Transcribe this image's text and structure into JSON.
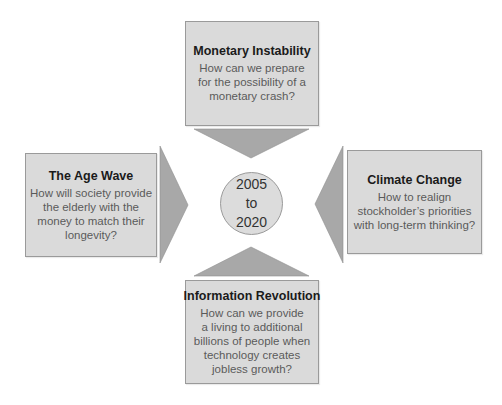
{
  "center": {
    "lines": [
      "2005",
      "to",
      "2020"
    ]
  },
  "boxes": {
    "top": {
      "title": "Monetary Instability",
      "lines": [
        "How can we prepare",
        "for the possibility of a",
        "monetary crash?"
      ]
    },
    "left": {
      "title": "The Age Wave",
      "lines": [
        "How will society provide",
        "the elderly with the",
        "money to match their",
        "longevity?"
      ]
    },
    "right": {
      "title": "Climate Change",
      "lines": [
        "How to realign",
        "stockholder’s priorities",
        "with long-term thinking?"
      ]
    },
    "bottom": {
      "title": "Information Revolution",
      "lines": [
        "How can we provide",
        "a living to additional",
        "billions of people when",
        "technology creates",
        "jobless growth?"
      ]
    }
  },
  "colors": {
    "box_fill": "#dadada",
    "box_border": "#9a9a9a",
    "arrow_fill": "#a8a8a8",
    "circle_fill": "#dcdcdc"
  }
}
